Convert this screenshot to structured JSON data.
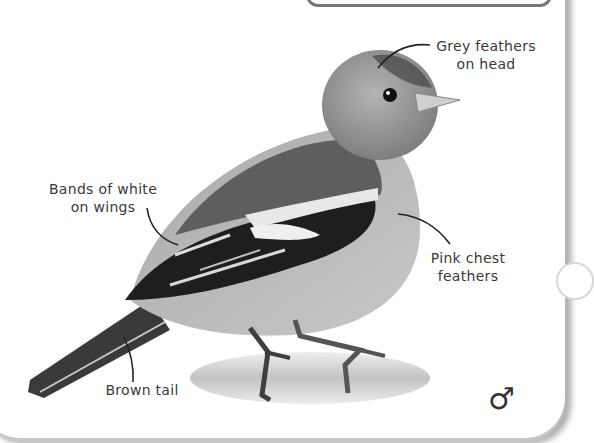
{
  "illustration": {
    "subject": "Chaffinch (male)",
    "tone": "grayscale"
  },
  "labels": {
    "head": [
      "Grey feathers",
      "on head"
    ],
    "wings": [
      "Bands of white",
      "on wings"
    ],
    "chest": [
      "Pink chest",
      "feathers"
    ],
    "tail": "Brown tail"
  },
  "symbol": {
    "sex": "♂",
    "sex_icon": "male-symbol-icon"
  },
  "colors": {
    "text": "#3a3a3a",
    "frame_border": "#777777",
    "background": "#ffffff"
  }
}
